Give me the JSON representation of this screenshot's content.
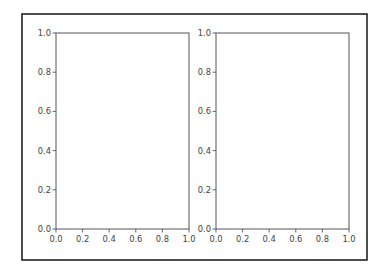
{
  "chart_data": [
    {
      "type": "line",
      "title": "",
      "xlabel": "",
      "ylabel": "",
      "xlim": [
        0.0,
        1.0
      ],
      "ylim": [
        0.0,
        1.0
      ],
      "x_ticks": [
        "0.0",
        "0.2",
        "0.4",
        "0.6",
        "0.8",
        "1.0"
      ],
      "y_ticks": [
        "0.0",
        "0.2",
        "0.4",
        "0.6",
        "0.8",
        "1.0"
      ],
      "series": [],
      "grid": false,
      "legend": "none"
    },
    {
      "type": "line",
      "title": "",
      "xlabel": "",
      "ylabel": "",
      "xlim": [
        0.0,
        1.0
      ],
      "ylim": [
        0.0,
        1.0
      ],
      "x_ticks": [
        "0.0",
        "0.2",
        "0.4",
        "0.6",
        "0.8",
        "1.0"
      ],
      "y_ticks": [
        "0.0",
        "0.2",
        "0.4",
        "0.6",
        "0.8",
        "1.0"
      ],
      "series": [],
      "grid": false,
      "legend": "none"
    }
  ]
}
